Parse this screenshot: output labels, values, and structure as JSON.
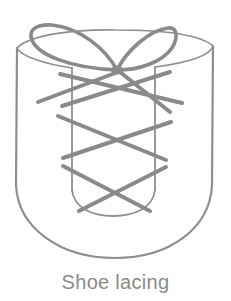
{
  "figure": {
    "caption": "Shoe lacing",
    "colors": {
      "line": "#8a8a8a",
      "caption": "#8a8a8a",
      "background": "#ffffff"
    }
  }
}
